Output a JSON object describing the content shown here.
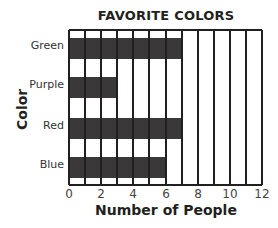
{
  "chart_data": {
    "type": "bar",
    "orientation": "horizontal",
    "title": "FAVORITE COLORS",
    "xlabel": "Number of People",
    "ylabel": "Color",
    "categories": [
      "Green",
      "Purple",
      "Red",
      "Blue"
    ],
    "values": [
      7,
      3,
      7,
      6
    ],
    "xlim": [
      0,
      12
    ],
    "xticks": [
      0,
      2,
      4,
      6,
      8,
      10,
      12
    ],
    "grid": true,
    "bar_color": "#3a3839"
  },
  "labels": {
    "title": "FAVORITE COLORS",
    "xlabel": "Number of People",
    "ylabel": "Color",
    "categories": [
      "Green",
      "Purple",
      "Red",
      "Blue"
    ],
    "ticks": [
      "0",
      "2",
      "4",
      "6",
      "8",
      "10",
      "12"
    ]
  }
}
